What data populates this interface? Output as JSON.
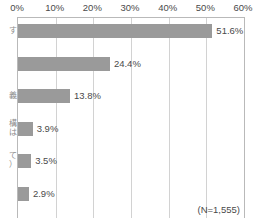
{
  "chart_data": {
    "type": "bar",
    "orientation": "horizontal",
    "title": "",
    "subtitle": "",
    "xlabel": "",
    "ylabel": "",
    "xlim": [
      0,
      60
    ],
    "xtick_step": 10,
    "grid": true,
    "legend": null,
    "bar_color": "#9a9a9a",
    "gridline_color": "#d2d2d2",
    "axis_color": "#b9b9b9",
    "tick_labels": [
      "0%",
      "10%",
      "20%",
      "30%",
      "40%",
      "50%",
      "60%"
    ],
    "tick_values": [
      0,
      10,
      20,
      30,
      40,
      50,
      60
    ],
    "categories": [
      "",
      "",
      "",
      "",
      "",
      ""
    ],
    "category_labels_cropped": [
      "す",
      "",
      "義",
      "構\nは",
      "て\n）",
      ""
    ],
    "values": [
      51.6,
      24.4,
      13.8,
      3.9,
      3.5,
      2.9
    ],
    "value_labels": [
      "51.6%",
      "24.4%",
      "13.8%",
      "3.9%",
      "3.5%",
      "2.9%"
    ],
    "annotation": "(N=1,555)"
  }
}
